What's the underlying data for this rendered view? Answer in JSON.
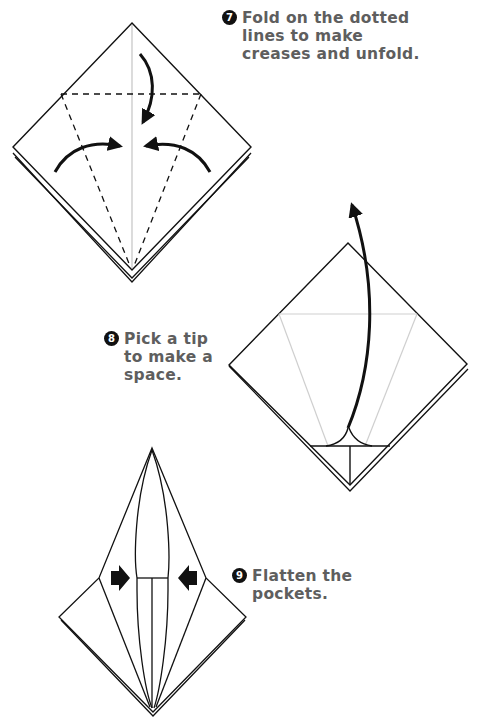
{
  "colors": {
    "line": "#111111",
    "crease": "#bdbdbd",
    "text": "#5e5e5e",
    "badge": "#111111"
  },
  "steps": [
    {
      "number": "7",
      "lines": [
        "Fold on the dotted",
        "lines to make",
        "creases and unfold."
      ],
      "icons": [
        "fold-down-arrow-icon",
        "fold-right-arrow-icon",
        "fold-left-arrow-icon"
      ]
    },
    {
      "number": "8",
      "lines": [
        "Pick a tip",
        "to make a",
        "space."
      ],
      "icons": [
        "lift-up-arrow-icon"
      ]
    },
    {
      "number": "9",
      "lines": [
        "Flatten the",
        "pockets."
      ],
      "icons": [
        "push-right-arrow-icon",
        "push-left-arrow-icon"
      ]
    }
  ]
}
